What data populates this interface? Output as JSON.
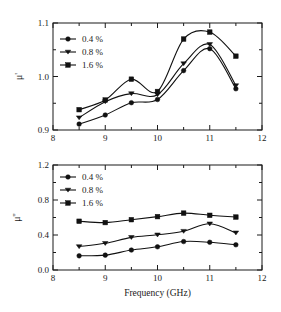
{
  "figure": {
    "panels": [
      "mu-prime-panel",
      "mu-double-prime-panel"
    ]
  },
  "chart_data": [
    {
      "id": "mu-prime",
      "type": "line",
      "title": "",
      "xlabel": "",
      "ylabel": "μ'",
      "xlim": [
        8,
        12
      ],
      "ylim": [
        0.9,
        1.1
      ],
      "xticks": [
        8,
        9,
        10,
        11,
        12
      ],
      "xticklabels": [
        "8",
        "9",
        "10",
        "11",
        "12"
      ],
      "yticks": [
        0.9,
        1.0,
        1.1
      ],
      "yticklabels": [
        "0.9",
        "1.0",
        "1.1"
      ],
      "minor_xticks": [
        8.5,
        9.5,
        10.5,
        11.5
      ],
      "minor_yticks": [
        0.95,
        1.05
      ],
      "grid": false,
      "legend_position": "upper-left",
      "x": [
        8.5,
        9.0,
        9.5,
        10.0,
        10.5,
        11.0,
        11.5
      ],
      "series": [
        {
          "name": "0.4 %",
          "marker": "circle",
          "values": [
            0.911,
            0.928,
            0.951,
            0.957,
            1.011,
            1.052,
            0.977
          ]
        },
        {
          "name": "0.8 %",
          "marker": "triangle",
          "values": [
            0.923,
            0.953,
            0.968,
            0.966,
            1.024,
            1.06,
            0.983
          ]
        },
        {
          "name": "1.6 %",
          "marker": "square",
          "values": [
            0.938,
            0.956,
            0.995,
            0.972,
            1.07,
            1.083,
            1.038
          ]
        }
      ]
    },
    {
      "id": "mu-double-prime",
      "type": "line",
      "title": "",
      "xlabel": "Frequency (GHz)",
      "ylabel": "μ''",
      "xlim": [
        8,
        12
      ],
      "ylim": [
        0.0,
        1.2
      ],
      "xticks": [
        8,
        9,
        10,
        11,
        12
      ],
      "xticklabels": [
        "8",
        "9",
        "10",
        "11",
        "12"
      ],
      "yticks": [
        0.0,
        0.4,
        0.8,
        1.2
      ],
      "yticklabels": [
        "0.0",
        "0.4",
        "0.8",
        "1.2"
      ],
      "minor_xticks": [
        8.5,
        9.5,
        10.5,
        11.5
      ],
      "minor_yticks": [
        0.2,
        0.6,
        1.0
      ],
      "grid": false,
      "legend_position": "upper-left",
      "x": [
        8.5,
        9.0,
        9.5,
        10.0,
        10.5,
        11.0,
        11.5
      ],
      "series": [
        {
          "name": "0.4 %",
          "marker": "circle",
          "values": [
            0.162,
            0.17,
            0.228,
            0.265,
            0.325,
            0.317,
            0.288
          ]
        },
        {
          "name": "0.8 %",
          "marker": "triangle",
          "values": [
            0.268,
            0.305,
            0.373,
            0.402,
            0.443,
            0.528,
            0.425
          ]
        },
        {
          "name": "1.6 %",
          "marker": "square",
          "values": [
            0.557,
            0.542,
            0.575,
            0.61,
            0.65,
            0.625,
            0.605
          ]
        }
      ]
    }
  ],
  "legend": {
    "items": [
      {
        "label": "0.4 %"
      },
      {
        "label": "0.8 %"
      },
      {
        "label": "1.6 %"
      }
    ]
  },
  "colors": {
    "ink": "#111111",
    "background": "#ffffff"
  }
}
